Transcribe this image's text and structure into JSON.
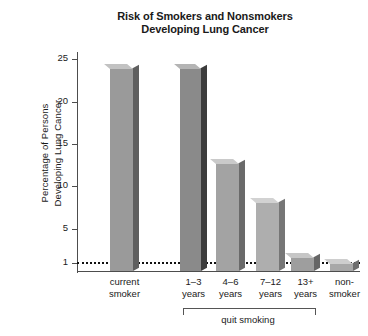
{
  "chart_data": {
    "type": "bar",
    "title": "Risk of Smokers and Nonsmokers Developing Lung Cancer",
    "title_lines": [
      "Risk of Smokers and Nonsmokers",
      "Developing Lung Cancer"
    ],
    "xlabel": "",
    "ylabel": "Percentage of Persons Developing Lung Cancer",
    "ylabel_lines": [
      "Percentage of Persons",
      "Developing  Lung Cancer"
    ],
    "categories": [
      "current smoker",
      "1–3 years",
      "4–6 years",
      "7–12 years",
      "13+ years",
      "non-smoker"
    ],
    "category_lines": [
      [
        "current",
        "smoker"
      ],
      [
        "1–3",
        "years"
      ],
      [
        "4–6",
        "years"
      ],
      [
        "7–12",
        "years"
      ],
      [
        "13+",
        "years"
      ],
      [
        "non-",
        "smoker"
      ]
    ],
    "values": [
      24,
      24,
      12.8,
      8.1,
      1.6,
      1
    ],
    "ylim": [
      0,
      26
    ],
    "yticks": [
      1,
      5,
      10,
      15,
      20,
      25
    ],
    "ytick_labels": [
      "1",
      "5",
      "10",
      "15",
      "20",
      "25"
    ],
    "grid": false,
    "legend": "none",
    "threshold_line": {
      "value": 1,
      "style": "dotted",
      "color": "#111111"
    },
    "group_bracket": {
      "label": "quit smoking",
      "spans_categories": [
        "1–3 years",
        "4–6 years",
        "7–12 years",
        "13+ years"
      ]
    },
    "bar_colors": [
      "#9a9a9a",
      "#8a8a8a",
      "#a3a3a3",
      "#aeaeae",
      "#9e9e9e",
      "#a8a8a8"
    ],
    "bar_side_colors": [
      "#5f5f5f",
      "#3c3c3c",
      "#6a6a6a",
      "#767676",
      "#666666",
      "#6e6e6e"
    ],
    "bar_top_colors": [
      "#c2c2c2",
      "#b4b4b4",
      "#cacaca",
      "#d2d2d2",
      "#c6c6c6",
      "#cecece"
    ],
    "axis_color": "#4d4d4d"
  }
}
